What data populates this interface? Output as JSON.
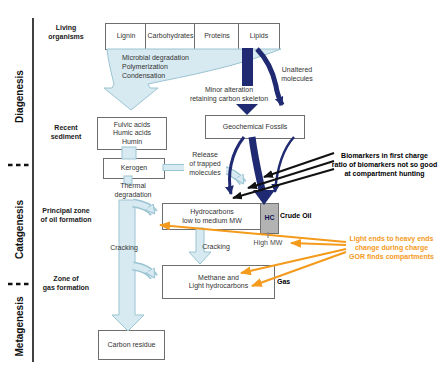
{
  "colors": {
    "navy": "#1f2a72",
    "lightblue": "#d7e9f1",
    "lightblue-border": "#9bc4d2",
    "orange": "#f49a1c",
    "graybox": "#b3b3b3",
    "ink": "#111111"
  },
  "axis": {
    "stage1": "Diagenesis",
    "stage2": "Catagenesis",
    "stage3": "Metagenesis",
    "row_living": "Living\norganisms",
    "row_recent": "Recent\nsediment",
    "row_oil": "Principal zone\nof oil formation",
    "row_gas": "Zone of\ngas formation"
  },
  "top_boxes": {
    "lignin": "Lignin",
    "carbohydrates": "Carbohydrates",
    "proteins": "Proteins",
    "lipids": "Lipids"
  },
  "boxes": {
    "fulvic": "Fulvic acids\nHumic acids\nHumin",
    "kerogen": "Kerogen",
    "geochemical": "Geochemical Fossils",
    "hydrocarbons": "Hydrocarbons\nlow to medium MW",
    "hc": "HC",
    "methane": "Methane and\nLight hydrocarbons",
    "carbon_residue": "Carbon residue"
  },
  "process": {
    "microbial": "Microbial degradation\nPolymerization\nCondensation",
    "minor_alteration": "Minor alteration\nretaining carbon skeleton",
    "unaltered": "Unaltered\nmolecules",
    "release": "Release\nof trapped\nmolecules",
    "thermal": "Thermal\ndegradation",
    "cracking_left": "Cracking",
    "cracking_mid": "Cracking"
  },
  "products": {
    "crude_oil": "Crude Oil",
    "high_mw": "High MW",
    "gas": "Gas"
  },
  "annotations": {
    "biomarkers": "Biomarkers in first charge\nratio of biomarkers not so good\nat compartment hunting",
    "light_ends": "Light ends to heavy ends\nchange during charge\nGOR finds compartments"
  }
}
